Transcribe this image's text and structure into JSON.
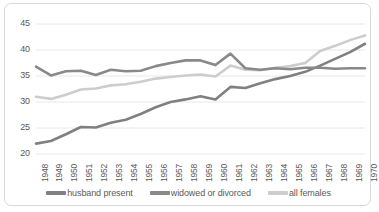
{
  "chart_data": {
    "type": "line",
    "title": "",
    "subtitle": "",
    "xlabel": "",
    "ylabel": "",
    "xlim": [
      1948,
      1970
    ],
    "ylim": [
      20,
      45
    ],
    "yticks": [
      20,
      25,
      30,
      35,
      40,
      45
    ],
    "grid": "horizontal",
    "legend_position": "bottom",
    "categories": [
      "1948",
      "1949",
      "1950",
      "1951",
      "1952",
      "1953",
      "1954",
      "1955",
      "1956",
      "1957",
      "1958",
      "1959",
      "1960",
      "1961",
      "1962",
      "1963",
      "1964",
      "1965",
      "1966",
      "1967",
      "1968",
      "1969",
      "1970"
    ],
    "series": [
      {
        "name": "husband present",
        "color": "#808080",
        "values": [
          22.0,
          22.5,
          23.8,
          25.2,
          25.1,
          26.0,
          26.6,
          27.7,
          29.0,
          30.0,
          30.5,
          31.1,
          30.5,
          32.9,
          32.7,
          33.6,
          34.4,
          35.0,
          35.8,
          37.0,
          38.3,
          39.6,
          41.2
        ]
      },
      {
        "name": "widowed or divorced",
        "color": "#898989",
        "values": [
          36.8,
          35.1,
          35.9,
          36.0,
          35.2,
          36.2,
          35.9,
          36.0,
          36.9,
          37.5,
          38.0,
          38.0,
          37.1,
          39.3,
          36.5,
          36.2,
          36.5,
          36.3,
          36.6,
          36.6,
          36.4,
          36.5,
          36.5
        ]
      },
      {
        "name": "all females",
        "color": "#cdcdcd",
        "values": [
          31.0,
          30.6,
          31.4,
          32.4,
          32.6,
          33.2,
          33.4,
          33.9,
          34.5,
          34.8,
          35.1,
          35.3,
          34.9,
          37.0,
          36.2,
          36.1,
          36.6,
          36.9,
          37.5,
          39.8,
          40.8,
          41.9,
          42.8
        ]
      }
    ]
  },
  "legend": [
    {
      "label": "husband present",
      "color": "#808080"
    },
    {
      "label": "widowed or divorced",
      "color": "#898989"
    },
    {
      "label": "all females",
      "color": "#cdcdcd"
    }
  ],
  "axes": {
    "y_tick_labels": [
      "45",
      "40",
      "35",
      "30",
      "25",
      "20"
    ],
    "x_tick_labels": [
      "1948",
      "1949",
      "1950",
      "1951",
      "1952",
      "1953",
      "1954",
      "1955",
      "1956",
      "1957",
      "1958",
      "1959",
      "1960",
      "1961",
      "1962",
      "1963",
      "1964",
      "1965",
      "1966",
      "1967",
      "1968",
      "1969",
      "1970"
    ]
  },
  "colors": {
    "gridline": "#e8e8e8",
    "axis_text": "#595959",
    "border": "#d9d9d9",
    "background": "#ffffff"
  }
}
